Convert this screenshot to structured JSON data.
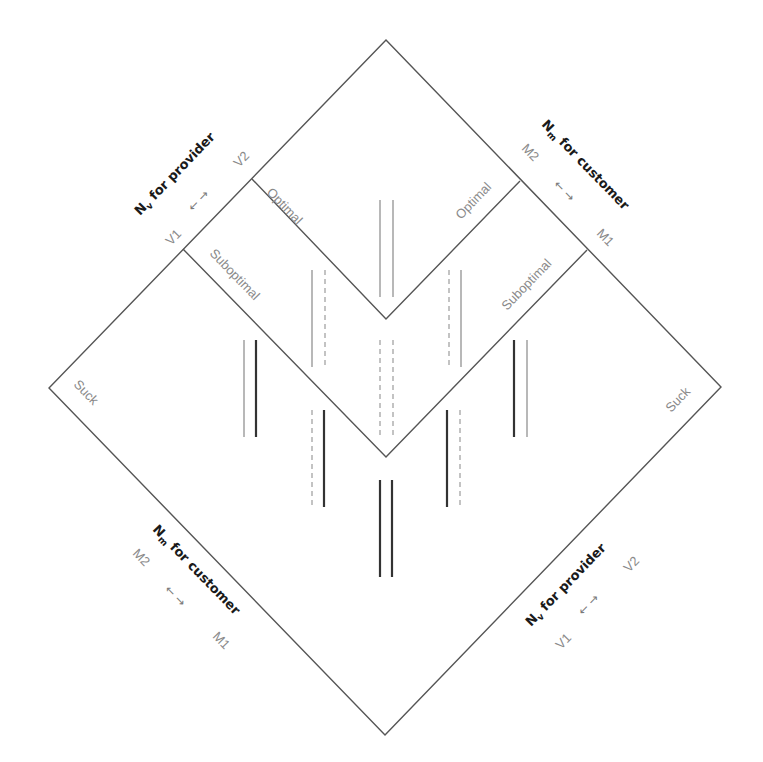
{
  "colors": {
    "outline": "#555555",
    "dark_line": "#333333",
    "light_line": "#9a9a9a",
    "dashed_line": "#aaaaaa",
    "region_text": "#8a8a8a",
    "axis_title_text": "#1a1a1a"
  },
  "regions": {
    "optimal_left": "Optimal",
    "optimal_right": "Optimal",
    "suboptimal_left": "Suboptimal",
    "suboptimal_right": "Suboptimal",
    "suck_left": "Suck",
    "suck_right": "Suck"
  },
  "axes": {
    "top_left": {
      "title_main": "N",
      "title_sub": "v",
      "title_rest": " for provider",
      "end_low": "V1",
      "end_high": "V2",
      "arrows": "←  →"
    },
    "top_right": {
      "title_main": "N",
      "title_sub": "m",
      "title_rest": " for customer",
      "end_low": "M1",
      "end_high": "M2",
      "arrows": "←  →"
    },
    "bottom_left": {
      "title_main": "N",
      "title_sub": "m",
      "title_rest": " for customer",
      "end_low": "M1",
      "end_high": "M2",
      "arrows": "←  →"
    },
    "bottom_right": {
      "title_main": "N",
      "title_sub": "v",
      "title_rest": " for provider",
      "end_low": "V1",
      "end_high": "V2",
      "arrows": "←  →"
    }
  },
  "shape": {
    "outer_diamond": {
      "top": [
        386,
        40
      ],
      "right": [
        721,
        387
      ],
      "bottom": [
        385,
        735
      ],
      "left": [
        49,
        388
      ]
    },
    "upper_v": {
      "left": [
        252,
        179
      ],
      "vertex": [
        386,
        319
      ],
      "right": [
        520,
        181
      ]
    },
    "lower_v": {
      "left": [
        183,
        249
      ],
      "vertex": [
        386,
        457
      ],
      "right": [
        587,
        250
      ]
    }
  },
  "line_pairs": [
    {
      "x1": 380,
      "x2": 393,
      "y1": 200,
      "y2": 297,
      "style1": "light",
      "style2": "light"
    },
    {
      "x1": 312,
      "x2": 325,
      "y1": 270,
      "y2": 367,
      "style1": "light",
      "style2": "dashed"
    },
    {
      "x1": 449,
      "x2": 461,
      "y1": 270,
      "y2": 367,
      "style1": "dashed",
      "style2": "light"
    },
    {
      "x1": 244,
      "x2": 256,
      "y1": 340,
      "y2": 437,
      "style1": "light",
      "style2": "dark"
    },
    {
      "x1": 380,
      "x2": 393,
      "y1": 340,
      "y2": 437,
      "style1": "dashed",
      "style2": "dashed"
    },
    {
      "x1": 514,
      "x2": 527,
      "y1": 340,
      "y2": 437,
      "style1": "dark",
      "style2": "light"
    },
    {
      "x1": 312,
      "x2": 324,
      "y1": 410,
      "y2": 507,
      "style1": "dashed",
      "style2": "dark"
    },
    {
      "x1": 447,
      "x2": 460,
      "y1": 410,
      "y2": 507,
      "style1": "dark",
      "style2": "dashed"
    },
    {
      "x1": 380,
      "x2": 392,
      "y1": 480,
      "y2": 577,
      "style1": "dark",
      "style2": "dark"
    }
  ]
}
